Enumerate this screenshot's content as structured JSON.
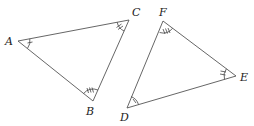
{
  "diagram": {
    "triangles": [
      {
        "name": "ABC",
        "vertices": [
          {
            "label": "A",
            "x": 18,
            "y": 41,
            "angle_marks": 1,
            "mark_style": "single arc, 1 tick"
          },
          {
            "label": "B",
            "x": 93,
            "y": 101,
            "angle_marks": 3,
            "mark_style": "single arc, 3 ticks"
          },
          {
            "label": "C",
            "x": 129,
            "y": 20,
            "angle_marks": 2,
            "mark_style": "single arc, 2 ticks"
          }
        ]
      },
      {
        "name": "DEF",
        "vertices": [
          {
            "label": "D",
            "x": 127,
            "y": 108,
            "angle_marks": 1,
            "mark_style": "single arc, 1 tick"
          },
          {
            "label": "E",
            "x": 236,
            "y": 76,
            "angle_marks": 2,
            "mark_style": "single arc, 2 ticks"
          },
          {
            "label": "F",
            "x": 163,
            "y": 21,
            "angle_marks": 3,
            "mark_style": "single arc, 3 ticks"
          }
        ]
      }
    ],
    "labels": {
      "A": "A",
      "B": "B",
      "C": "C",
      "D": "D",
      "E": "E",
      "F": "F"
    },
    "colors": {
      "line": "#555555",
      "text": "#222222",
      "background": "#ffffff"
    }
  }
}
